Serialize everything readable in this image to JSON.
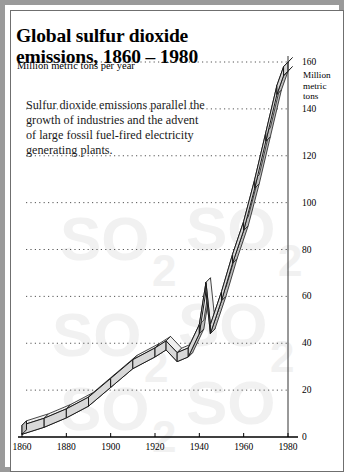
{
  "title": "Global sulfur dioxide emissions, 1860 – 1980",
  "subtitle": "Million metric tons per year",
  "body_text": "Sulfur dioxide emissions parallel the growth of industries and the advent of large fossil fuel-fired electricity generating plants.",
  "axis_unit_label": {
    "line1": "Million",
    "line2": "metric",
    "line3": "tons"
  },
  "watermark_text": "SO2",
  "colors": {
    "frame_outer": "#9a9a9a",
    "frame_inner": "#6f6f6f",
    "band_fill": "#d8d8d8",
    "band_side": "#bdbdbd",
    "band_top": "#efefef",
    "band_stroke": "#1a1a1a",
    "gridline": "#555555",
    "axis": "#333333",
    "text": "#000000",
    "watermark": "#f0f0f0"
  },
  "chart_data": {
    "type": "line",
    "title": "Global sulfur dioxide emissions, 1860 – 1980",
    "subtitle": "Million metric tons per year",
    "xlabel": "",
    "ylabel": "Million metric tons",
    "ylabel_position": "right",
    "grid": "horizontal-dotted",
    "legend": "none",
    "xlim": [
      1860,
      1980
    ],
    "ylim": [
      0,
      160
    ],
    "xticks": [
      1860,
      1880,
      1900,
      1920,
      1940,
      1960,
      1980
    ],
    "yticks": [
      0,
      20,
      40,
      60,
      80,
      100,
      120,
      140,
      160
    ],
    "xtick_labels": [
      "1860",
      "1880",
      "1900",
      "1920",
      "1940",
      "1960",
      "1980"
    ],
    "ytick_labels": [
      "0",
      "20",
      "40",
      "60",
      "80",
      "100",
      "120",
      "140",
      "160"
    ],
    "x": [
      1860,
      1870,
      1880,
      1890,
      1900,
      1910,
      1920,
      1925,
      1930,
      1935,
      1940,
      1943,
      1945,
      1950,
      1955,
      1960,
      1965,
      1970,
      1975,
      1978,
      1980
    ],
    "y": [
      5,
      8,
      12,
      17,
      25,
      33,
      38,
      41,
      36,
      38,
      48,
      66,
      48,
      62,
      78,
      92,
      110,
      130,
      150,
      158,
      160
    ],
    "series": [
      {
        "name": "Global SO2 emissions",
        "values": [
          5,
          8,
          12,
          17,
          25,
          33,
          38,
          41,
          36,
          38,
          48,
          66,
          48,
          62,
          78,
          92,
          110,
          130,
          150,
          158,
          160
        ]
      }
    ],
    "annotations": [
      {
        "x": 1930,
        "y": 36,
        "note": "dip"
      },
      {
        "x": 1943,
        "y": 66,
        "note": "wartime spike"
      },
      {
        "x": 1945,
        "y": 48,
        "note": "postwar drop"
      }
    ]
  }
}
